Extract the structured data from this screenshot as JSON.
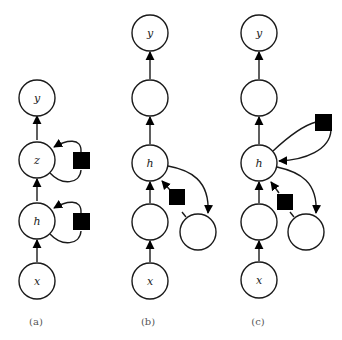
{
  "figure": {
    "panels": [
      {
        "caption": "(a)",
        "nodes": [
          {
            "id": "y",
            "label": "y"
          },
          {
            "id": "z",
            "label": "z"
          },
          {
            "id": "h",
            "label": "h"
          },
          {
            "id": "x",
            "label": "x"
          }
        ],
        "edges": [
          [
            "x",
            "h"
          ],
          [
            "h",
            "z"
          ],
          [
            "z",
            "y"
          ],
          [
            "h",
            "h",
            "via-square"
          ],
          [
            "z",
            "z",
            "via-square"
          ]
        ]
      },
      {
        "caption": "(b)",
        "nodes": [
          {
            "id": "y",
            "label": "y"
          },
          {
            "id": "u2",
            "label": ""
          },
          {
            "id": "h",
            "label": "h"
          },
          {
            "id": "u1",
            "label": ""
          },
          {
            "id": "x",
            "label": "x"
          },
          {
            "id": "m",
            "label": ""
          }
        ],
        "edges": [
          [
            "x",
            "u1"
          ],
          [
            "u1",
            "h"
          ],
          [
            "h",
            "u2"
          ],
          [
            "u2",
            "y"
          ],
          [
            "h",
            "m"
          ],
          [
            "m",
            "h",
            "via-square"
          ]
        ]
      },
      {
        "caption": "(c)",
        "nodes": [
          {
            "id": "y",
            "label": "y"
          },
          {
            "id": "u2",
            "label": ""
          },
          {
            "id": "h",
            "label": "h"
          },
          {
            "id": "u1",
            "label": ""
          },
          {
            "id": "x",
            "label": "x"
          },
          {
            "id": "m",
            "label": ""
          }
        ],
        "edges": [
          [
            "x",
            "u1"
          ],
          [
            "u1",
            "h"
          ],
          [
            "h",
            "u2"
          ],
          [
            "u2",
            "y"
          ],
          [
            "h",
            "m"
          ],
          [
            "m",
            "h",
            "via-square"
          ],
          [
            "h",
            "h",
            "via-square"
          ]
        ]
      }
    ]
  }
}
